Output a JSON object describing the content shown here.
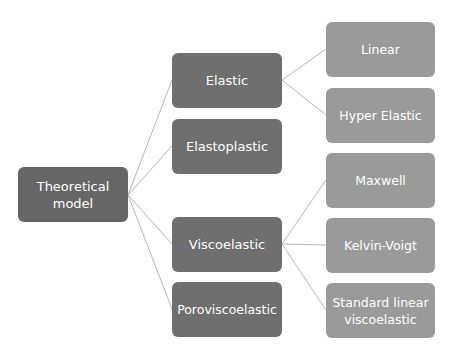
{
  "diagram": {
    "type": "hierarchy-tree",
    "root": {
      "label": "Theoretical\nmodel",
      "line1": "Theoretical",
      "line2": "model"
    },
    "level1": [
      {
        "label": "Elastic"
      },
      {
        "label": "Elastoplastic"
      },
      {
        "label": "Viscoelastic"
      },
      {
        "label": "Poroviscoelastic"
      }
    ],
    "level2": [
      {
        "label": "Linear",
        "parent": "Elastic"
      },
      {
        "label": "Hyper Elastic",
        "parent": "Elastic"
      },
      {
        "label": "Maxwell",
        "parent": "Viscoelastic"
      },
      {
        "label": "Kelvin-Voigt",
        "parent": "Viscoelastic"
      },
      {
        "label": "Standard linear viscoelastic",
        "line1": "Standard linear",
        "line2": "viscoelastic",
        "parent": "Viscoelastic"
      }
    ],
    "colors": {
      "root": "#666666",
      "level1": "#6f6f6f",
      "level2": "#9a9a9a",
      "connector": "#b0b0b0",
      "text": "#ffffff"
    }
  }
}
